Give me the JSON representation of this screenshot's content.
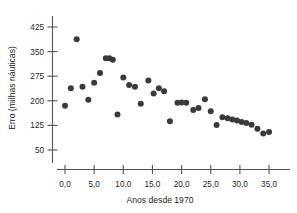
{
  "chart_data": {
    "type": "scatter",
    "title": "",
    "xlabel": "Anos desde 1970",
    "ylabel": "Erro (milhas náuticas)",
    "xlim": [
      -2.0,
      41.0
    ],
    "ylim": [
      25,
      450
    ],
    "grid": false,
    "legend": null,
    "x_ticks": [
      0,
      5,
      10,
      15,
      20,
      25,
      30,
      35,
      40
    ],
    "x_tick_labels": [
      "0,0",
      "5,0",
      "10,0",
      "15,0",
      "20,0",
      "25,0",
      "30,0",
      "35,0",
      ""
    ],
    "y_ticks": [
      50,
      125,
      200,
      275,
      350,
      425
    ],
    "y_tick_labels": [
      "50",
      "125",
      "200",
      "275",
      "350",
      "425"
    ],
    "marker_color": "#3a3a3a",
    "marker_size": 3.0,
    "points": [
      {
        "x": 0.0,
        "y": 185
      },
      {
        "x": 1.0,
        "y": 238
      },
      {
        "x": 2.0,
        "y": 388
      },
      {
        "x": 3.0,
        "y": 243
      },
      {
        "x": 4.0,
        "y": 203
      },
      {
        "x": 5.0,
        "y": 255
      },
      {
        "x": 6.0,
        "y": 285
      },
      {
        "x": 7.0,
        "y": 330
      },
      {
        "x": 7.6,
        "y": 330
      },
      {
        "x": 8.2,
        "y": 325
      },
      {
        "x": 9.0,
        "y": 158
      },
      {
        "x": 10.0,
        "y": 271
      },
      {
        "x": 11.0,
        "y": 248
      },
      {
        "x": 12.0,
        "y": 243
      },
      {
        "x": 13.0,
        "y": 191
      },
      {
        "x": 14.3,
        "y": 262
      },
      {
        "x": 15.2,
        "y": 222
      },
      {
        "x": 16.1,
        "y": 238
      },
      {
        "x": 17.0,
        "y": 229
      },
      {
        "x": 18.0,
        "y": 138
      },
      {
        "x": 19.3,
        "y": 194
      },
      {
        "x": 20.0,
        "y": 195
      },
      {
        "x": 20.8,
        "y": 194
      },
      {
        "x": 22.0,
        "y": 172
      },
      {
        "x": 22.9,
        "y": 178
      },
      {
        "x": 24.0,
        "y": 205
      },
      {
        "x": 25.0,
        "y": 168
      },
      {
        "x": 26.0,
        "y": 126
      },
      {
        "x": 27.0,
        "y": 150
      },
      {
        "x": 27.9,
        "y": 147
      },
      {
        "x": 28.7,
        "y": 143
      },
      {
        "x": 29.5,
        "y": 140
      },
      {
        "x": 30.3,
        "y": 135
      },
      {
        "x": 31.1,
        "y": 132
      },
      {
        "x": 32.0,
        "y": 127
      },
      {
        "x": 33.0,
        "y": 115
      },
      {
        "x": 34.0,
        "y": 100
      },
      {
        "x": 35.0,
        "y": 105
      }
    ]
  }
}
